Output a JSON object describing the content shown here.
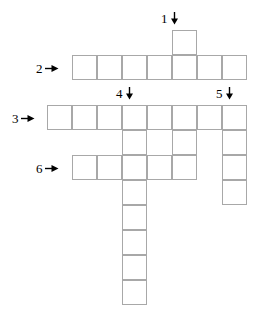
{
  "puzzle": {
    "title": "Crossword grid",
    "cell_size": 25,
    "grid_origin": {
      "x": 47,
      "y": 30
    },
    "colors": {
      "cell_border": "#a8a8a8",
      "cell_fill": "#ffffff",
      "background": "#ffffff",
      "label_text": "#000000",
      "arrow": "#000000"
    },
    "clues": [
      {
        "id": "clue-1",
        "number": "1",
        "direction": "down",
        "arrow_icon": "arrow-down-icon",
        "x": 161,
        "y": 12
      },
      {
        "id": "clue-2",
        "number": "2",
        "direction": "across",
        "arrow_icon": "arrow-right-icon",
        "x": 36,
        "y": 62
      },
      {
        "id": "clue-3",
        "number": "3",
        "direction": "across",
        "arrow_icon": "arrow-right-icon",
        "x": 12,
        "y": 112
      },
      {
        "id": "clue-4",
        "number": "4",
        "direction": "down",
        "arrow_icon": "arrow-down-icon",
        "x": 116,
        "y": 87
      },
      {
        "id": "clue-5",
        "number": "5",
        "direction": "down",
        "arrow_icon": "arrow-down-icon",
        "x": 216,
        "y": 87
      },
      {
        "id": "clue-6",
        "number": "6",
        "direction": "across",
        "arrow_icon": "arrow-right-icon",
        "x": 36,
        "y": 162
      }
    ],
    "entries": [
      {
        "id": "entry-1-down",
        "number": "1",
        "direction": "down",
        "length": 6,
        "start_col": 5,
        "start_row": 0
      },
      {
        "id": "entry-2-across",
        "number": "2",
        "direction": "across",
        "length": 7,
        "start_col": 1,
        "start_row": 1
      },
      {
        "id": "entry-3-across",
        "number": "3",
        "direction": "across",
        "length": 8,
        "start_col": 0,
        "start_row": 3
      },
      {
        "id": "entry-4-down",
        "number": "4",
        "direction": "down",
        "length": 9,
        "start_col": 3,
        "start_row": 3
      },
      {
        "id": "entry-5-down",
        "number": "5",
        "direction": "down",
        "length": 5,
        "start_col": 7,
        "start_row": 3
      },
      {
        "id": "entry-6-across",
        "number": "6",
        "direction": "across",
        "length": 5,
        "start_col": 1,
        "start_row": 5
      }
    ],
    "cells": [
      {
        "col": 5,
        "row": 0
      },
      {
        "col": 1,
        "row": 1
      },
      {
        "col": 2,
        "row": 1
      },
      {
        "col": 3,
        "row": 1
      },
      {
        "col": 4,
        "row": 1
      },
      {
        "col": 5,
        "row": 1
      },
      {
        "col": 6,
        "row": 1
      },
      {
        "col": 7,
        "row": 1
      },
      {
        "col": 0,
        "row": 3
      },
      {
        "col": 1,
        "row": 3
      },
      {
        "col": 2,
        "row": 3
      },
      {
        "col": 3,
        "row": 3
      },
      {
        "col": 4,
        "row": 3
      },
      {
        "col": 5,
        "row": 3
      },
      {
        "col": 6,
        "row": 3
      },
      {
        "col": 7,
        "row": 3
      },
      {
        "col": 3,
        "row": 4
      },
      {
        "col": 5,
        "row": 4
      },
      {
        "col": 7,
        "row": 4
      },
      {
        "col": 1,
        "row": 5
      },
      {
        "col": 2,
        "row": 5
      },
      {
        "col": 3,
        "row": 5
      },
      {
        "col": 4,
        "row": 5
      },
      {
        "col": 5,
        "row": 5
      },
      {
        "col": 7,
        "row": 5
      },
      {
        "col": 3,
        "row": 6
      },
      {
        "col": 7,
        "row": 6
      },
      {
        "col": 3,
        "row": 7
      },
      {
        "col": 3,
        "row": 8
      },
      {
        "col": 3,
        "row": 9
      },
      {
        "col": 3,
        "row": 10
      }
    ]
  }
}
